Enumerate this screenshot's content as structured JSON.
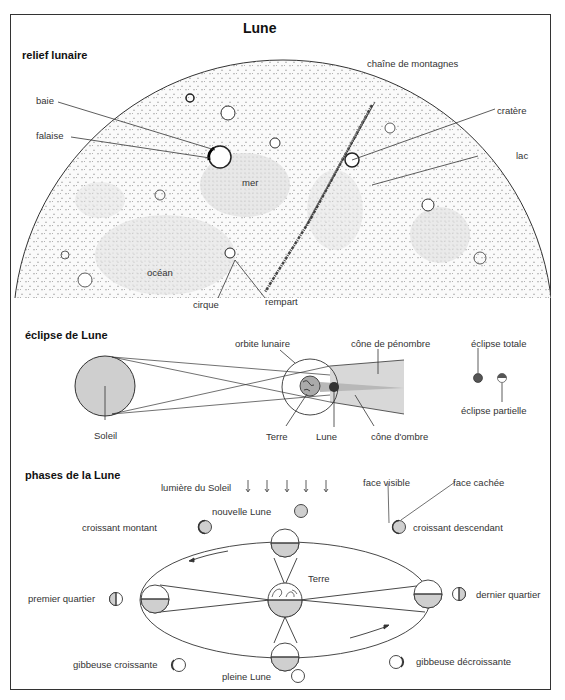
{
  "title": "Lune",
  "sections": {
    "relief": {
      "heading": "relief lunaire",
      "labels": {
        "baie": "baie",
        "falaise": "falaise",
        "mer": "mer",
        "ocean": "océan",
        "cirque": "cirque",
        "rempart": "rempart",
        "chaine": "chaîne de montagnes",
        "cratere": "cratère",
        "lac": "lac"
      }
    },
    "eclipse": {
      "heading": "éclipse de Lune",
      "labels": {
        "soleil": "Soleil",
        "orbite": "orbite lunaire",
        "terre": "Terre",
        "lune": "Lune",
        "penombre": "cône de pénombre",
        "ombre": "cône d'ombre",
        "totale": "éclipse totale",
        "partielle": "éclipse partielle"
      }
    },
    "phases": {
      "heading": "phases de la Lune",
      "labels": {
        "lumiere": "lumière du Soleil",
        "nouvelle": "nouvelle Lune",
        "croissant_montant": "croissant montant",
        "premier_quartier": "premier quartier",
        "gibbeuse_croissante": "gibbeuse croissante",
        "pleine": "pleine Lune",
        "terre": "Terre",
        "dernier_quartier": "dernier quartier",
        "gibbeuse_decroissante": "gibbeuse décroissante",
        "croissant_descendant": "croissant descendant",
        "face_visible": "face visible",
        "face_cachee": "face cachée"
      }
    }
  },
  "colors": {
    "line": "#333333",
    "shade": "#c8c8c8",
    "moon_fill": "#f4f4f4",
    "dark": "#444444"
  }
}
